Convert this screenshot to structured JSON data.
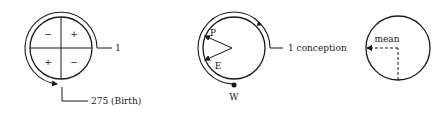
{
  "diagrams": [
    {
      "id": "quadrant-cycle",
      "quadrant_signs": [
        "−",
        "+",
        "+",
        "−"
      ],
      "start_label": "1",
      "end_label": "275 (Birth)"
    },
    {
      "id": "conception-cycle",
      "start_label": "1 conception",
      "point_labels": {
        "p": "P",
        "e": "E",
        "w": "W"
      }
    },
    {
      "id": "mean-circle",
      "mean_label": "mean"
    }
  ],
  "colors": {
    "stroke": "#1a1a1a",
    "background": "#ffffff"
  }
}
